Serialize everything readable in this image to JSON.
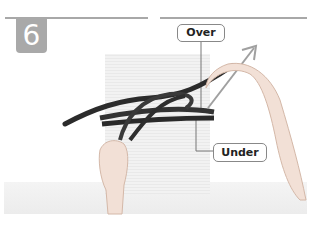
{
  "step": {
    "number": "6"
  },
  "labels": {
    "over": "Over",
    "under": "Under"
  },
  "colors": {
    "step_badge": "#a9a9a9",
    "arrow": "#999999",
    "rope": "#2a2a2a",
    "divider": "#a8a8a8"
  }
}
